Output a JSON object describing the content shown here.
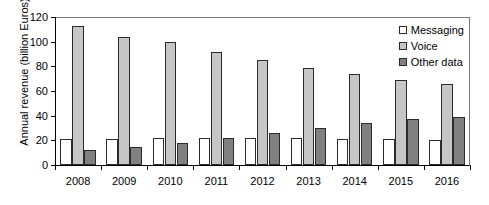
{
  "chart_data": {
    "type": "bar",
    "title": "",
    "subtitle": "",
    "xlabel": "",
    "ylabel": "Annual revenue (billion Euros)",
    "categories": [
      "2008",
      "2009",
      "2010",
      "2011",
      "2012",
      "2013",
      "2014",
      "2015",
      "2016"
    ],
    "series": [
      {
        "name": "Messaging",
        "color": "#ffffff",
        "values": [
          21,
          21,
          22,
          22,
          22,
          22,
          21,
          21,
          20
        ]
      },
      {
        "name": "Voice",
        "color": "#c6c6c6",
        "values": [
          113,
          104,
          100,
          92,
          85,
          79,
          74,
          69,
          66
        ]
      },
      {
        "name": "Other data",
        "color": "#808080",
        "values": [
          12,
          15,
          18,
          22,
          26,
          30,
          34,
          37,
          39
        ]
      }
    ],
    "ylim": [
      0,
      120
    ],
    "yticks": [
      0,
      20,
      40,
      60,
      80,
      100,
      120
    ],
    "ytick_labels": [
      "0",
      "20",
      "40",
      "60",
      "80",
      "100",
      "120"
    ],
    "grid": false,
    "legend_position": "top-right-inside",
    "axis_color": "#000000",
    "plot_border_color": "#7a7a7a",
    "bar_outline_color": "#2b2b2b"
  }
}
